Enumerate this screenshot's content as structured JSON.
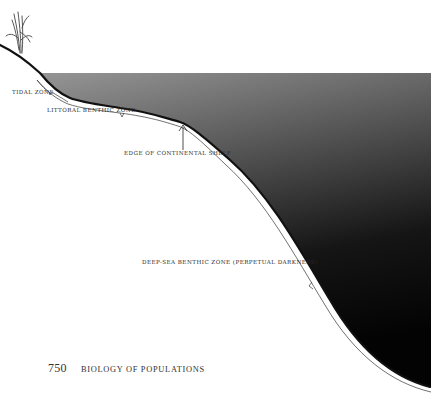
{
  "figure": {
    "labels": {
      "tidal_zone": "TIDAL ZONE",
      "littoral_benthic_zone": "LITTORAL BENTHIC ZONE",
      "edge_of_continental_shelf": "EDGE OF CONTINENTAL SHELF",
      "deep_sea_benthic_zone": "DEEP-SEA BENTHIC ZONE (PERPETUAL DARKNESS)"
    },
    "colors": {
      "water_surface": "#8f8f8f",
      "water_deep": "#050505",
      "seafloor_line": "#111111",
      "page_background": "#ffffff"
    }
  },
  "footer": {
    "page_number": "750",
    "running_head": "BIOLOGY OF POPULATIONS"
  }
}
